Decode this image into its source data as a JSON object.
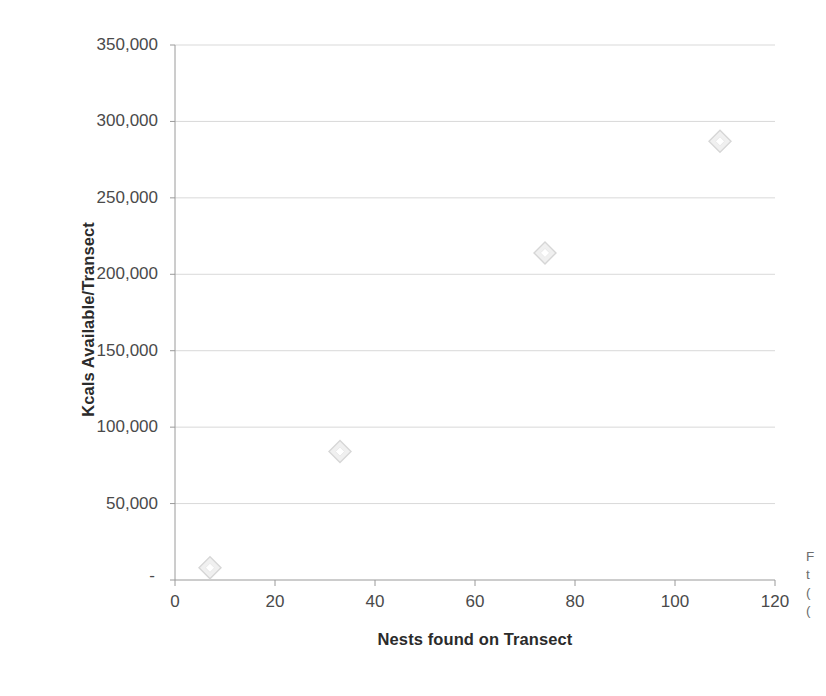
{
  "figure": {
    "background": "#ffffff",
    "plot_area": {
      "left": 175,
      "top": 45,
      "right": 775,
      "bottom": 580
    }
  },
  "axis_style": {
    "axis_color": "#9a9a9a",
    "grid_color": "#d9d9d9",
    "tick_text_color": "#4a4a4a",
    "title_color": "#2b2b2b",
    "marker_fill": "#f0f0f0",
    "marker_stroke": "#d6d6d6"
  },
  "side_caption": {
    "lines": [
      "F",
      "t",
      "(",
      "("
    ]
  },
  "chart_data": {
    "type": "scatter",
    "title": "",
    "xlabel": "Nests found on Transect",
    "ylabel": "Kcals Available/Transect",
    "xlim": [
      0,
      120
    ],
    "ylim": [
      0,
      350000
    ],
    "grid": true,
    "legend": false,
    "xticks": [
      0,
      20,
      40,
      60,
      80,
      100,
      120
    ],
    "xticklabels": [
      "0",
      "20",
      "40",
      "60",
      "80",
      "100",
      "120"
    ],
    "yticks": [
      0,
      50000,
      100000,
      150000,
      200000,
      250000,
      300000,
      350000
    ],
    "yticklabels": [
      "-",
      "50,000",
      "100,000",
      "150,000",
      "200,000",
      "250,000",
      "300,000",
      "350,000"
    ],
    "series": [
      {
        "name": "Kcals Available/Transect",
        "marker": "diamond",
        "points": [
          {
            "x": 7,
            "y": 8000
          },
          {
            "x": 33,
            "y": 84000
          },
          {
            "x": 74,
            "y": 214000
          },
          {
            "x": 109,
            "y": 287000
          }
        ]
      }
    ]
  }
}
